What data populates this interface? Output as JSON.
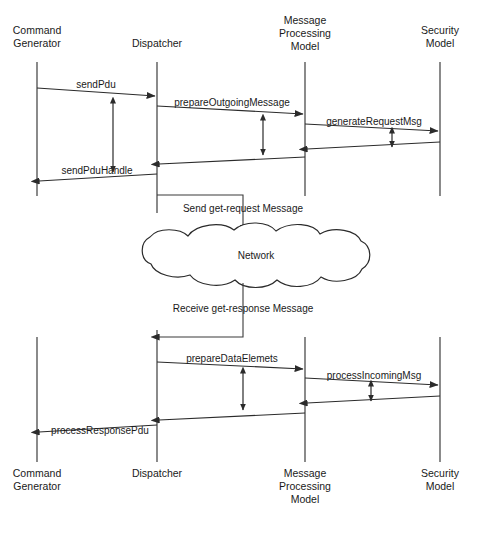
{
  "diagram": {
    "background_color": "#ffffff",
    "line_color": "#2b2b2b",
    "text_color": "#1a1a1a"
  },
  "actors": [
    {
      "id": "command-generator",
      "line1": "Command",
      "line2": "Generator",
      "x": 37
    },
    {
      "id": "dispatcher",
      "line1": "Dispatcher",
      "line2": "",
      "x": 157
    },
    {
      "id": "message-processing-model",
      "line1": "Message",
      "line2": "Processing",
      "line3": "Model",
      "x": 305
    },
    {
      "id": "security-model",
      "line1": "Security",
      "line2": "Model",
      "x": 440
    }
  ],
  "messages": {
    "send_pdu": "sendPdu",
    "prepare_outgoing_message": "prepareOutgoingMessage",
    "generate_request_msg": "generateRequestMsg",
    "send_pdu_handle": "sendPduHandle",
    "prepare_data_elemets": "prepareDataElemets",
    "process_incoming_msg": "processIncomingMsg",
    "process_response_pdu": "processResponsePdu"
  },
  "notes": {
    "send_request": "Send get-request Message",
    "receive_response": "Receive get-response Message"
  },
  "network": {
    "label": "Network"
  }
}
